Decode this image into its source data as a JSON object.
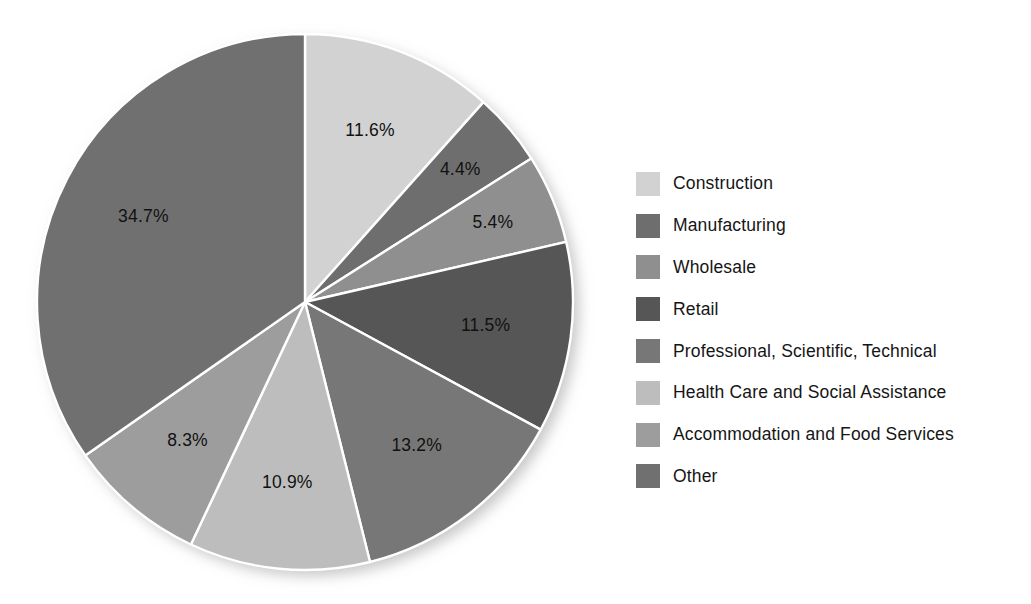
{
  "chart_data": {
    "type": "pie",
    "title": "",
    "subtitle": "",
    "xlabel": "",
    "ylabel": "",
    "grid": false,
    "legend_position": "right",
    "start_angle_deg": 0,
    "direction": "clockwise",
    "total": 100.0,
    "units": "percent",
    "categories": [
      "Construction",
      "Manufacturing",
      "Wholesale",
      "Retail",
      "Professional, Scientific, Technical",
      "Health Care and Social Assistance",
      "Accommodation and Food Services",
      "Other"
    ],
    "values": [
      11.6,
      4.4,
      5.4,
      11.5,
      13.2,
      10.9,
      8.3,
      34.7
    ],
    "value_labels": [
      "11.6%",
      "4.4%",
      "5.4%",
      "11.5%",
      "13.2%",
      "10.9%",
      "8.3%",
      "34.7%"
    ],
    "colors": [
      "#d2d2d2",
      "#6e6e6e",
      "#8f8f8f",
      "#565656",
      "#777777",
      "#bdbdbd",
      "#9d9d9d",
      "#707070"
    ],
    "slices": [
      {
        "label": "Construction",
        "value": 11.6,
        "value_label": "11.6%",
        "color": "#d2d2d2"
      },
      {
        "label": "Manufacturing",
        "value": 4.4,
        "value_label": "4.4%",
        "color": "#6e6e6e"
      },
      {
        "label": "Wholesale",
        "value": 5.4,
        "value_label": "5.4%",
        "color": "#8f8f8f"
      },
      {
        "label": "Retail",
        "value": 11.5,
        "value_label": "11.5%",
        "color": "#565656"
      },
      {
        "label": "Professional, Scientific, Technical",
        "value": 13.2,
        "value_label": "13.2%",
        "color": "#777777"
      },
      {
        "label": "Health Care and Social Assistance",
        "value": 10.9,
        "value_label": "10.9%",
        "color": "#bdbdbd"
      },
      {
        "label": "Accommodation and Food Services",
        "value": 8.3,
        "value_label": "8.3%",
        "color": "#9d9d9d"
      },
      {
        "label": "Other",
        "value": 34.7,
        "value_label": "34.7%",
        "color": "#707070"
      }
    ]
  },
  "legend": {
    "items": [
      {
        "label": "Construction",
        "color": "#d2d2d2"
      },
      {
        "label": "Manufacturing",
        "color": "#6e6e6e"
      },
      {
        "label": "Wholesale",
        "color": "#8f8f8f"
      },
      {
        "label": "Retail",
        "color": "#565656"
      },
      {
        "label": "Professional, Scientific, Technical",
        "color": "#777777"
      },
      {
        "label": "Health Care and Social Assistance",
        "color": "#bdbdbd"
      },
      {
        "label": "Accommodation and Food Services",
        "color": "#9d9d9d"
      },
      {
        "label": "Other",
        "color": "#707070"
      }
    ]
  },
  "geometry": {
    "center_x": 305,
    "center_y": 302,
    "radius": 268,
    "label_radius_factor": 0.68,
    "separator_color": "#ffffff",
    "separator_width": 2.4
  }
}
